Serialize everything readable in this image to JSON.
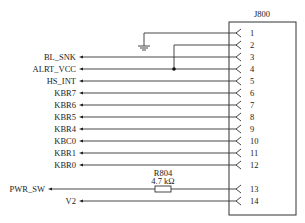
{
  "connector": {
    "ref": "J800",
    "pins": [
      {
        "num": "1",
        "signal": "",
        "net": "GND"
      },
      {
        "num": "2",
        "signal": "",
        "net": "ALRT_VCC"
      },
      {
        "num": "3",
        "signal": "BL_SNK"
      },
      {
        "num": "4",
        "signal": "ALRT_VCC"
      },
      {
        "num": "5",
        "signal": "HS_INT"
      },
      {
        "num": "6",
        "signal": "KBR7"
      },
      {
        "num": "7",
        "signal": "KBR6"
      },
      {
        "num": "8",
        "signal": "KBR5"
      },
      {
        "num": "9",
        "signal": "KBR4"
      },
      {
        "num": "10",
        "signal": "KBC0"
      },
      {
        "num": "11",
        "signal": "KBR1"
      },
      {
        "num": "12",
        "signal": "KBR0"
      },
      {
        "num": "13",
        "signal": "PWR_SW"
      },
      {
        "num": "14",
        "signal": "V2"
      }
    ]
  },
  "resistor": {
    "ref": "R804",
    "value": "4.7 kΩ",
    "pin": "13"
  },
  "ground": {
    "pin": "1",
    "symbol": "ground-icon"
  },
  "junction": {
    "from_pin": "2",
    "to_pin": "4"
  }
}
